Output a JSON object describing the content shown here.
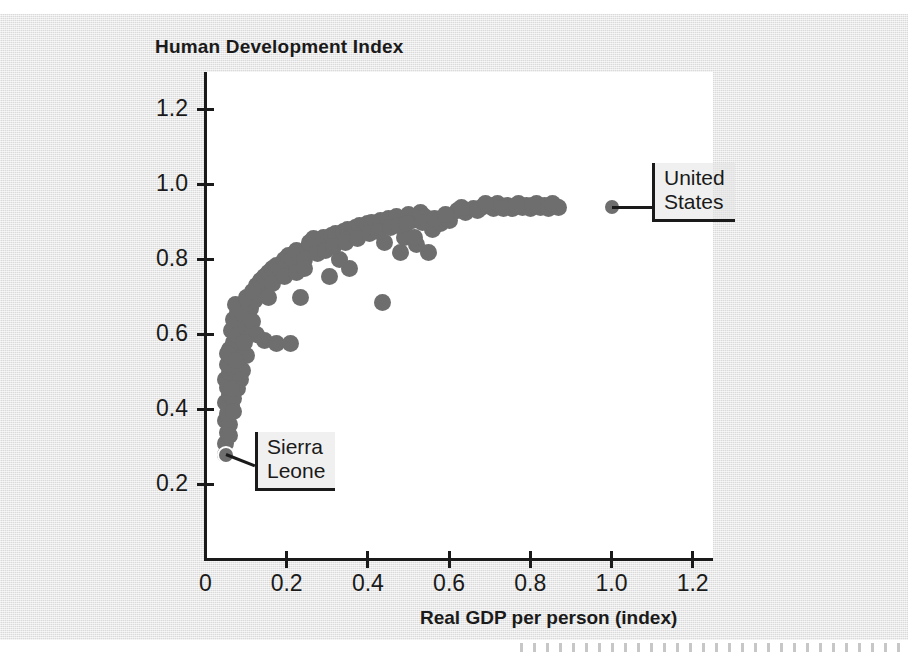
{
  "chart_data": {
    "type": "scatter",
    "title": "Human Development Index",
    "xlabel": "Real GDP per person (index)",
    "ylabel": "Human Development Index",
    "xlim": [
      0,
      1.25
    ],
    "ylim": [
      0,
      1.3
    ],
    "grid": false,
    "legend": "none",
    "marker_color": "#6e6e6e",
    "xticks": [
      "0",
      "0.2",
      "0.4",
      "0.6",
      "0.8",
      "1.0",
      "1.2"
    ],
    "xtick_values": [
      0,
      0.2,
      0.4,
      0.6,
      0.8,
      1.0,
      1.2
    ],
    "yticks": [
      "0.2",
      "0.4",
      "0.6",
      "0.8",
      "1.0",
      "1.2"
    ],
    "ytick_values": [
      0.2,
      0.4,
      0.6,
      0.8,
      1.0,
      1.2
    ],
    "annotations": [
      {
        "label": "United States",
        "x": 1.0,
        "y": 0.94
      },
      {
        "label": "Sierra Leone",
        "x": 0.05,
        "y": 0.28
      }
    ],
    "points": [
      [
        0.05,
        0.28
      ],
      [
        0.05,
        0.31
      ],
      [
        0.055,
        0.34
      ],
      [
        0.05,
        0.37
      ],
      [
        0.06,
        0.36
      ],
      [
        0.055,
        0.39
      ],
      [
        0.065,
        0.41
      ],
      [
        0.05,
        0.42
      ],
      [
        0.06,
        0.44
      ],
      [
        0.07,
        0.43
      ],
      [
        0.055,
        0.46
      ],
      [
        0.065,
        0.47
      ],
      [
        0.05,
        0.48
      ],
      [
        0.075,
        0.49
      ],
      [
        0.06,
        0.5
      ],
      [
        0.07,
        0.51
      ],
      [
        0.055,
        0.52
      ],
      [
        0.08,
        0.53
      ],
      [
        0.065,
        0.54
      ],
      [
        0.075,
        0.55
      ],
      [
        0.06,
        0.56
      ],
      [
        0.085,
        0.57
      ],
      [
        0.07,
        0.58
      ],
      [
        0.055,
        0.55
      ],
      [
        0.09,
        0.59
      ],
      [
        0.075,
        0.6
      ],
      [
        0.065,
        0.61
      ],
      [
        0.1,
        0.62
      ],
      [
        0.085,
        0.63
      ],
      [
        0.07,
        0.64
      ],
      [
        0.095,
        0.65
      ],
      [
        0.08,
        0.66
      ],
      [
        0.11,
        0.67
      ],
      [
        0.075,
        0.68
      ],
      [
        0.09,
        0.655
      ],
      [
        0.105,
        0.685
      ],
      [
        0.12,
        0.69
      ],
      [
        0.1,
        0.7
      ],
      [
        0.13,
        0.705
      ],
      [
        0.115,
        0.715
      ],
      [
        0.14,
        0.72
      ],
      [
        0.125,
        0.73
      ],
      [
        0.15,
        0.735
      ],
      [
        0.135,
        0.745
      ],
      [
        0.16,
        0.75
      ],
      [
        0.145,
        0.755
      ],
      [
        0.17,
        0.76
      ],
      [
        0.155,
        0.765
      ],
      [
        0.18,
        0.77
      ],
      [
        0.165,
        0.775
      ],
      [
        0.19,
        0.78
      ],
      [
        0.175,
        0.785
      ],
      [
        0.2,
        0.79
      ],
      [
        0.185,
        0.775
      ],
      [
        0.21,
        0.795
      ],
      [
        0.195,
        0.8
      ],
      [
        0.22,
        0.805
      ],
      [
        0.205,
        0.81
      ],
      [
        0.23,
        0.815
      ],
      [
        0.215,
        0.8
      ],
      [
        0.24,
        0.82
      ],
      [
        0.225,
        0.825
      ],
      [
        0.25,
        0.83
      ],
      [
        0.235,
        0.79
      ],
      [
        0.26,
        0.835
      ],
      [
        0.245,
        0.8
      ],
      [
        0.27,
        0.84
      ],
      [
        0.255,
        0.845
      ],
      [
        0.28,
        0.85
      ],
      [
        0.265,
        0.855
      ],
      [
        0.29,
        0.86
      ],
      [
        0.3,
        0.845
      ],
      [
        0.31,
        0.865
      ],
      [
        0.32,
        0.87
      ],
      [
        0.33,
        0.855
      ],
      [
        0.34,
        0.875
      ],
      [
        0.35,
        0.88
      ],
      [
        0.36,
        0.865
      ],
      [
        0.37,
        0.885
      ],
      [
        0.38,
        0.89
      ],
      [
        0.39,
        0.875
      ],
      [
        0.4,
        0.895
      ],
      [
        0.41,
        0.9
      ],
      [
        0.42,
        0.885
      ],
      [
        0.43,
        0.905
      ],
      [
        0.44,
        0.845
      ],
      [
        0.45,
        0.91
      ],
      [
        0.46,
        0.9
      ],
      [
        0.47,
        0.915
      ],
      [
        0.48,
        0.82
      ],
      [
        0.49,
        0.86
      ],
      [
        0.5,
        0.92
      ],
      [
        0.51,
        0.905
      ],
      [
        0.52,
        0.84
      ],
      [
        0.53,
        0.925
      ],
      [
        0.54,
        0.915
      ],
      [
        0.55,
        0.82
      ],
      [
        0.56,
        0.88
      ],
      [
        0.58,
        0.895
      ],
      [
        0.6,
        0.905
      ],
      [
        0.62,
        0.93
      ],
      [
        0.64,
        0.925
      ],
      [
        0.66,
        0.935
      ],
      [
        0.68,
        0.94
      ],
      [
        0.7,
        0.945
      ],
      [
        0.71,
        0.935
      ],
      [
        0.72,
        0.95
      ],
      [
        0.73,
        0.94
      ],
      [
        0.745,
        0.945
      ],
      [
        0.755,
        0.935
      ],
      [
        0.77,
        0.95
      ],
      [
        0.78,
        0.94
      ],
      [
        0.79,
        0.945
      ],
      [
        0.8,
        0.935
      ],
      [
        0.815,
        0.95
      ],
      [
        0.825,
        0.94
      ],
      [
        0.835,
        0.945
      ],
      [
        0.845,
        0.935
      ],
      [
        0.86,
        0.945
      ],
      [
        0.87,
        0.94
      ],
      [
        0.115,
        0.635
      ],
      [
        0.125,
        0.6
      ],
      [
        0.145,
        0.585
      ],
      [
        0.175,
        0.575
      ],
      [
        0.21,
        0.575
      ],
      [
        0.235,
        0.7
      ],
      [
        0.305,
        0.755
      ],
      [
        0.355,
        0.775
      ],
      [
        0.435,
        0.685
      ],
      [
        0.33,
        0.8
      ],
      [
        0.09,
        0.505
      ],
      [
        0.1,
        0.545
      ],
      [
        0.085,
        0.48
      ],
      [
        0.095,
        0.58
      ],
      [
        0.08,
        0.455
      ],
      [
        0.155,
        0.7
      ],
      [
        0.165,
        0.735
      ],
      [
        0.195,
        0.755
      ],
      [
        0.225,
        0.765
      ],
      [
        0.245,
        0.775
      ],
      [
        0.275,
        0.815
      ],
      [
        0.295,
        0.825
      ],
      [
        0.315,
        0.835
      ],
      [
        0.345,
        0.845
      ],
      [
        0.375,
        0.855
      ],
      [
        0.405,
        0.87
      ],
      [
        0.425,
        0.875
      ],
      [
        0.455,
        0.885
      ],
      [
        0.475,
        0.89
      ],
      [
        0.495,
        0.895
      ],
      [
        0.515,
        0.86
      ],
      [
        0.535,
        0.9
      ],
      [
        0.565,
        0.91
      ],
      [
        0.59,
        0.92
      ],
      [
        0.63,
        0.94
      ],
      [
        0.67,
        0.93
      ],
      [
        0.69,
        0.95
      ],
      [
        0.735,
        0.935
      ],
      [
        0.765,
        0.945
      ],
      [
        0.805,
        0.945
      ],
      [
        0.855,
        0.95
      ],
      [
        0.06,
        0.33
      ],
      [
        0.07,
        0.395
      ],
      [
        0.065,
        0.455
      ],
      [
        0.075,
        0.53
      ]
    ]
  }
}
